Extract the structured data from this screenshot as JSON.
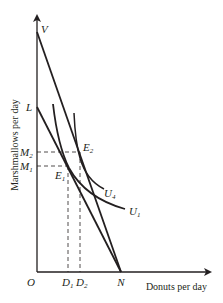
{
  "diagram": {
    "axes": {
      "y_label": "Marshmallows per day",
      "x_label": "Donuts per day",
      "origin": "O"
    },
    "points": {
      "V": "V",
      "L": "L",
      "N": "N",
      "E1": {
        "base": "E",
        "sub": "1"
      },
      "E2": {
        "base": "E",
        "sub": "2"
      },
      "M1": {
        "base": "M",
        "sub": "1"
      },
      "M2": {
        "base": "M",
        "sub": "2"
      },
      "D1": {
        "base": "D",
        "sub": "1"
      },
      "D2": {
        "base": "D",
        "sub": "2"
      }
    },
    "curves": {
      "U1": {
        "base": "U",
        "sub": "1"
      },
      "U4": {
        "base": "U",
        "sub": "4"
      }
    },
    "lines": [
      "budget line LN",
      "budget line VN"
    ],
    "colors": {
      "ink": "#231f20",
      "background": "#ffffff"
    }
  }
}
